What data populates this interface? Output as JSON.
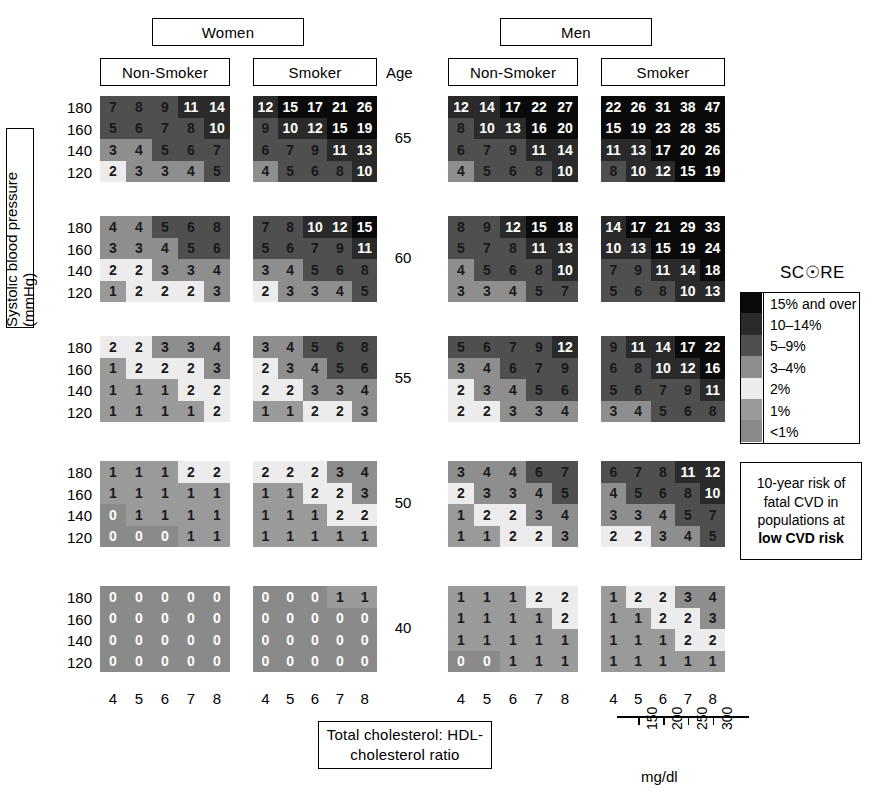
{
  "title_headers": {
    "women": "Women",
    "men": "Men",
    "age": "Age",
    "non_smoker": "Non-Smoker",
    "smoker": "Smoker"
  },
  "axes": {
    "y_title": "Systolic blood pressure (mmHg)",
    "x_title_line1": "Total cholesterol: HDL-",
    "x_title_line2": "cholesterol ratio",
    "sbp_ticks": [
      "180",
      "160",
      "140",
      "120"
    ],
    "chol_ticks": [
      "4",
      "5",
      "6",
      "7",
      "8"
    ],
    "age_ticks": [
      "65",
      "60",
      "55",
      "50",
      "40"
    ],
    "mgdl_ticks": [
      "150",
      "200",
      "250",
      "300"
    ],
    "mgdl_unit": "mg/dl"
  },
  "legend": {
    "title": "SCORE",
    "bands": [
      {
        "label": "15% and over",
        "color": "#0a0a0a",
        "class": "b-15"
      },
      {
        "label": "10–14%",
        "color": "#2a2a2a",
        "class": "b-1014"
      },
      {
        "label": "5–9%",
        "color": "#4f4f4f",
        "class": "b-59"
      },
      {
        "label": "3–4%",
        "color": "#8e8e8e",
        "class": "b-34"
      },
      {
        "label": "2%",
        "color": "#ececec",
        "class": "b-2"
      },
      {
        "label": "1%",
        "color": "#9a9a9a",
        "class": "b-1"
      },
      {
        "label": "<1%",
        "color": "#8a8a8a",
        "class": "b-lt1"
      }
    ],
    "note_lines": [
      "10-year risk of",
      "fatal CVD in",
      "populations at"
    ],
    "note_bold": "low CVD risk"
  },
  "chart_data": {
    "type": "heatmap",
    "xlabel": "Total cholesterol: HDL-cholesterol ratio",
    "ylabel": "Systolic blood pressure (mmHg)",
    "x": [
      4,
      5,
      6,
      7,
      8
    ],
    "y": [
      180,
      160,
      140,
      120
    ],
    "ages": [
      65,
      60,
      55,
      50,
      40
    ],
    "grid": false,
    "legend_position": "right",
    "panels": [
      {
        "sex": "Women",
        "smoking": "Non-Smoker",
        "age": 65,
        "values": [
          [
            7,
            8,
            9,
            11,
            14
          ],
          [
            5,
            6,
            7,
            8,
            10
          ],
          [
            3,
            4,
            5,
            6,
            7
          ],
          [
            2,
            3,
            3,
            4,
            5
          ]
        ]
      },
      {
        "sex": "Women",
        "smoking": "Smoker",
        "age": 65,
        "values": [
          [
            12,
            15,
            17,
            21,
            26
          ],
          [
            9,
            10,
            12,
            15,
            19
          ],
          [
            6,
            7,
            9,
            11,
            13
          ],
          [
            4,
            5,
            6,
            8,
            10
          ]
        ]
      },
      {
        "sex": "Men",
        "smoking": "Non-Smoker",
        "age": 65,
        "values": [
          [
            12,
            14,
            17,
            22,
            27
          ],
          [
            8,
            10,
            13,
            16,
            20
          ],
          [
            6,
            7,
            9,
            11,
            14
          ],
          [
            4,
            5,
            6,
            8,
            10
          ]
        ]
      },
      {
        "sex": "Men",
        "smoking": "Smoker",
        "age": 65,
        "values": [
          [
            22,
            26,
            31,
            38,
            47
          ],
          [
            15,
            19,
            23,
            28,
            35
          ],
          [
            11,
            13,
            17,
            20,
            26
          ],
          [
            8,
            10,
            12,
            15,
            19
          ]
        ]
      },
      {
        "sex": "Women",
        "smoking": "Non-Smoker",
        "age": 60,
        "values": [
          [
            4,
            4,
            5,
            6,
            8
          ],
          [
            3,
            3,
            4,
            5,
            6
          ],
          [
            2,
            2,
            3,
            3,
            4
          ],
          [
            1,
            2,
            2,
            2,
            3
          ]
        ]
      },
      {
        "sex": "Women",
        "smoking": "Smoker",
        "age": 60,
        "values": [
          [
            7,
            8,
            10,
            12,
            15
          ],
          [
            5,
            6,
            7,
            9,
            11
          ],
          [
            3,
            4,
            5,
            6,
            8
          ],
          [
            2,
            3,
            3,
            4,
            5
          ]
        ]
      },
      {
        "sex": "Men",
        "smoking": "Non-Smoker",
        "age": 60,
        "values": [
          [
            8,
            9,
            12,
            15,
            18
          ],
          [
            5,
            7,
            8,
            11,
            13
          ],
          [
            4,
            5,
            6,
            8,
            10
          ],
          [
            3,
            3,
            4,
            5,
            7
          ]
        ]
      },
      {
        "sex": "Men",
        "smoking": "Smoker",
        "age": 60,
        "values": [
          [
            14,
            17,
            21,
            29,
            33
          ],
          [
            10,
            13,
            15,
            19,
            24
          ],
          [
            7,
            9,
            11,
            14,
            18
          ],
          [
            5,
            6,
            8,
            10,
            13
          ]
        ]
      },
      {
        "sex": "Women",
        "smoking": "Non-Smoker",
        "age": 55,
        "values": [
          [
            2,
            2,
            3,
            3,
            4
          ],
          [
            1,
            2,
            2,
            2,
            3
          ],
          [
            1,
            1,
            1,
            2,
            2
          ],
          [
            1,
            1,
            1,
            1,
            2
          ]
        ]
      },
      {
        "sex": "Women",
        "smoking": "Smoker",
        "age": 55,
        "values": [
          [
            3,
            4,
            5,
            6,
            8
          ],
          [
            2,
            3,
            4,
            5,
            6
          ],
          [
            2,
            2,
            3,
            3,
            4
          ],
          [
            1,
            1,
            2,
            2,
            3
          ]
        ]
      },
      {
        "sex": "Men",
        "smoking": "Non-Smoker",
        "age": 55,
        "values": [
          [
            5,
            6,
            7,
            9,
            12
          ],
          [
            3,
            4,
            6,
            7,
            9
          ],
          [
            2,
            3,
            4,
            5,
            6
          ],
          [
            2,
            2,
            3,
            3,
            4
          ]
        ]
      },
      {
        "sex": "Men",
        "smoking": "Smoker",
        "age": 55,
        "values": [
          [
            9,
            11,
            14,
            17,
            22
          ],
          [
            6,
            8,
            10,
            12,
            16
          ],
          [
            5,
            6,
            7,
            9,
            11
          ],
          [
            3,
            4,
            5,
            6,
            8
          ]
        ]
      },
      {
        "sex": "Women",
        "smoking": "Non-Smoker",
        "age": 50,
        "values": [
          [
            1,
            1,
            1,
            2,
            2
          ],
          [
            1,
            1,
            1,
            1,
            1
          ],
          [
            0,
            1,
            1,
            1,
            1
          ],
          [
            0,
            0,
            0,
            1,
            1
          ]
        ]
      },
      {
        "sex": "Women",
        "smoking": "Smoker",
        "age": 50,
        "values": [
          [
            2,
            2,
            2,
            3,
            4
          ],
          [
            1,
            1,
            2,
            2,
            3
          ],
          [
            1,
            1,
            1,
            2,
            2
          ],
          [
            1,
            1,
            1,
            1,
            1
          ]
        ]
      },
      {
        "sex": "Men",
        "smoking": "Non-Smoker",
        "age": 50,
        "values": [
          [
            3,
            4,
            4,
            6,
            7
          ],
          [
            2,
            3,
            3,
            4,
            5
          ],
          [
            1,
            2,
            2,
            3,
            4
          ],
          [
            1,
            1,
            2,
            2,
            3
          ]
        ]
      },
      {
        "sex": "Men",
        "smoking": "Smoker",
        "age": 50,
        "values": [
          [
            6,
            7,
            8,
            11,
            12
          ],
          [
            4,
            5,
            6,
            8,
            10
          ],
          [
            3,
            3,
            4,
            5,
            7
          ],
          [
            2,
            2,
            3,
            4,
            5
          ]
        ]
      },
      {
        "sex": "Women",
        "smoking": "Non-Smoker",
        "age": 40,
        "values": [
          [
            0,
            0,
            0,
            0,
            0
          ],
          [
            0,
            0,
            0,
            0,
            0
          ],
          [
            0,
            0,
            0,
            0,
            0
          ],
          [
            0,
            0,
            0,
            0,
            0
          ]
        ]
      },
      {
        "sex": "Women",
        "smoking": "Smoker",
        "age": 40,
        "values": [
          [
            0,
            0,
            0,
            1,
            1
          ],
          [
            0,
            0,
            0,
            0,
            0
          ],
          [
            0,
            0,
            0,
            0,
            0
          ],
          [
            0,
            0,
            0,
            0,
            0
          ]
        ]
      },
      {
        "sex": "Men",
        "smoking": "Non-Smoker",
        "age": 40,
        "values": [
          [
            1,
            1,
            1,
            2,
            2
          ],
          [
            1,
            1,
            1,
            1,
            2
          ],
          [
            1,
            1,
            1,
            1,
            1
          ],
          [
            0,
            0,
            1,
            1,
            1
          ]
        ]
      },
      {
        "sex": "Men",
        "smoking": "Smoker",
        "age": 40,
        "values": [
          [
            1,
            2,
            2,
            3,
            4
          ],
          [
            1,
            1,
            2,
            2,
            3
          ],
          [
            1,
            1,
            1,
            2,
            2
          ],
          [
            1,
            1,
            1,
            1,
            1
          ]
        ]
      }
    ]
  }
}
